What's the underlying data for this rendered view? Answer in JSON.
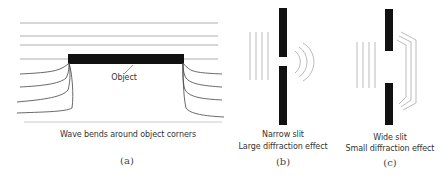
{
  "panels": [
    {
      "id": "a",
      "label": "(a)",
      "object_label": "Object",
      "caption": "Wave bends around object corners"
    },
    {
      "id": "b",
      "label": "(b)",
      "caption_line1": "Narrow slit",
      "caption_line2": "Large diffraction effect"
    },
    {
      "id": "c",
      "label": "(c)",
      "caption_line1": "Wide slit",
      "caption_line2": "Small diffraction effect"
    }
  ],
  "colors": {
    "barrier": "#111111",
    "wave": "#555555",
    "wave_light": "#aaaaaa"
  }
}
